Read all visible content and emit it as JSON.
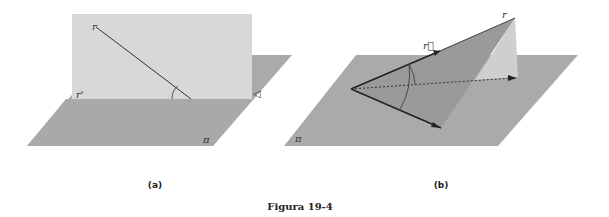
{
  "figure": {
    "caption": "Figura 19-4",
    "panels": [
      {
        "id": "a",
        "label": "(a)",
        "labels": {
          "line": "r",
          "projection": "r'",
          "plane": "π",
          "angle_mark": "◁"
        }
      },
      {
        "id": "b",
        "label": "(b)",
        "labels": {
          "vector": "r⃗",
          "line": "r",
          "plane": "π"
        }
      }
    ]
  },
  "colors": {
    "horizontal_plane": "#a9a9a9",
    "vertical_plane": "#d6d6d6",
    "wedge_dark": "#9a9a9a",
    "wedge_light": "#c8c8c8",
    "line": "#333333"
  }
}
